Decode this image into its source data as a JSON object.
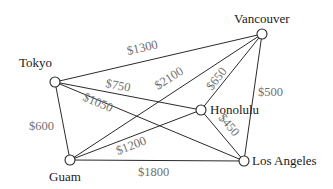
{
  "diagram": {
    "title": "",
    "nodes": [
      {
        "id": "tokyo",
        "label": "Tokyo",
        "x": 55,
        "y": 82
      },
      {
        "id": "vancouver",
        "label": "Vancouver",
        "x": 262,
        "y": 34
      },
      {
        "id": "honolulu",
        "label": "Honolulu",
        "x": 201,
        "y": 110
      },
      {
        "id": "guam",
        "label": "Guam",
        "x": 70,
        "y": 160
      },
      {
        "id": "los_angeles",
        "label": "Los Angeles",
        "x": 244,
        "y": 161
      }
    ],
    "edges": [
      {
        "from": "Tokyo",
        "to": "Vancouver",
        "fare": "$1300"
      },
      {
        "from": "Tokyo",
        "to": "Honolulu",
        "fare": "$750"
      },
      {
        "from": "Tokyo",
        "to": "Los Angeles",
        "fare": "$1050"
      },
      {
        "from": "Tokyo",
        "to": "Guam",
        "fare": "$600"
      },
      {
        "from": "Guam",
        "to": "Vancouver",
        "fare": "$2100"
      },
      {
        "from": "Guam",
        "to": "Honolulu",
        "fare": "$1200"
      },
      {
        "from": "Guam",
        "to": "Los Angeles",
        "fare": "$1800"
      },
      {
        "from": "Honolulu",
        "to": "Vancouver",
        "fare": "$650"
      },
      {
        "from": "Honolulu",
        "to": "Los Angeles",
        "fare": "$450"
      },
      {
        "from": "Vancouver",
        "to": "Los Angeles",
        "fare": "$500"
      }
    ]
  }
}
